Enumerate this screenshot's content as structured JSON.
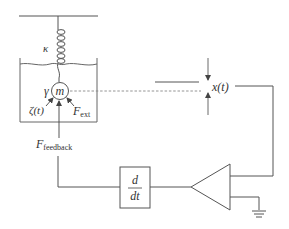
{
  "diagram": {
    "colors": {
      "line": "#555555",
      "text": "#333333",
      "dashed": "#888888"
    },
    "labels": {
      "spring_constant": "κ",
      "damping": "γ",
      "mass": "m",
      "noise_force": "ζ(t)",
      "external_force_main": "F",
      "external_force_sub": "ext",
      "feedback_force_main": "F",
      "feedback_force_sub": "feedback",
      "displacement": "x(t)",
      "derivative_numerator": "d",
      "derivative_denominator": "dt"
    },
    "components": [
      {
        "id": "ceiling",
        "type": "fixed-support"
      },
      {
        "id": "spring",
        "type": "spring",
        "label": "κ"
      },
      {
        "id": "fluid-tank",
        "type": "container",
        "note": "viscous fluid"
      },
      {
        "id": "mass",
        "type": "mass",
        "label": "m",
        "damping": "γ"
      },
      {
        "id": "position-detector",
        "type": "measurement",
        "label": "x(t)"
      },
      {
        "id": "amplifier",
        "type": "amplifier"
      },
      {
        "id": "ground",
        "type": "ground"
      },
      {
        "id": "differentiator",
        "type": "block",
        "label": "d/dt"
      }
    ],
    "connections": [
      {
        "from": "mass",
        "to": "position-detector",
        "style": "dashed"
      },
      {
        "from": "position-detector",
        "to": "amplifier"
      },
      {
        "from": "amplifier",
        "to": "ground"
      },
      {
        "from": "amplifier",
        "to": "differentiator"
      },
      {
        "from": "differentiator",
        "to": "mass",
        "label": "F_feedback"
      }
    ]
  }
}
